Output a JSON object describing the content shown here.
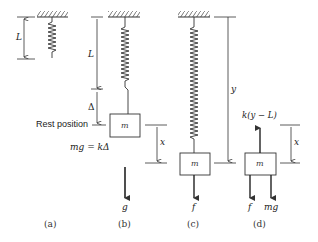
{
  "figure": {
    "panels": [
      {
        "id": "a",
        "caption": "(a)",
        "length_label": "L"
      },
      {
        "id": "b",
        "caption": "(b)",
        "length_label": "L",
        "extension_label": "Δ",
        "rest_label": "Rest position",
        "equilibrium_eq": "mg = kΔ",
        "mass_label": "m",
        "displacement_label": "x",
        "gravity_label": "g"
      },
      {
        "id": "c",
        "caption": "(c)",
        "mass_label": "m",
        "position_label": "y",
        "force_label": "f"
      },
      {
        "id": "d",
        "caption": "(d)",
        "mass_label": "m",
        "spring_force_label": "k(y − L)",
        "displacement_label": "x",
        "force_labels": [
          "f",
          "mg"
        ]
      }
    ],
    "colors": {
      "line": "#333333",
      "background": "#ffffff"
    }
  }
}
